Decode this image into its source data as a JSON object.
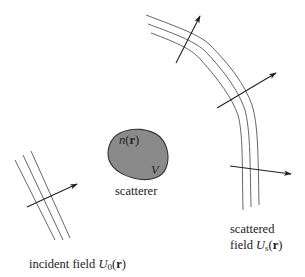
{
  "diagram": {
    "type": "scattering-schematic",
    "colors": {
      "line": "#555555",
      "arrow": "#222222",
      "scatterer_fill": "#8a8a8a",
      "scatterer_stroke": "#333333",
      "text": "#222222"
    },
    "scatterer": {
      "index_label_fn": "n",
      "index_label_arg": "r",
      "volume_label": "V",
      "caption": "scatterer"
    },
    "incident": {
      "caption_text": "incident field ",
      "field_symbol": "U",
      "field_subscript": "0",
      "field_arg": "r"
    },
    "scattered": {
      "caption_line1": "scattered",
      "caption_line2_text": "field ",
      "field_symbol": "U",
      "field_subscript": "s",
      "field_arg": "r"
    },
    "paren_open": "(",
    "paren_close": ")"
  }
}
